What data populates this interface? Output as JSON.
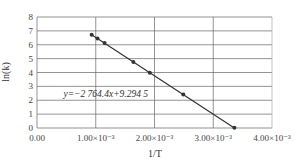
{
  "chart_data": {
    "type": "scatter",
    "title": "",
    "xlabel": "1/T",
    "ylabel": "ln(k)",
    "xlim": [
      0,
      0.004
    ],
    "ylim": [
      0,
      8
    ],
    "grid": true,
    "legend": "none",
    "x_ticks": [
      0,
      0.001,
      0.002,
      0.003,
      0.004
    ],
    "x_tick_labels": [
      "0.00",
      "1.00×10⁻³",
      "2.00×10⁻³",
      "3.00×10⁻³",
      "4.00×10⁻³"
    ],
    "y_ticks": [
      0,
      1,
      2,
      3,
      4,
      5,
      6,
      7,
      8
    ],
    "y_tick_labels": [
      "0",
      "1",
      "2",
      "3",
      "4",
      "5",
      "6",
      "7",
      "8"
    ],
    "series": [
      {
        "name": "ln(k) data",
        "x": [
          0.00093,
          0.00103,
          0.00115,
          0.00164,
          0.00192,
          0.00249,
          0.00336
        ],
        "y": [
          6.72,
          6.45,
          6.12,
          4.76,
          3.99,
          2.41,
          0.01
        ]
      }
    ],
    "trendline": {
      "type": "linear",
      "slope": -2764.4,
      "intercept": 9.2945,
      "x_range": [
        0.00093,
        0.00336
      ],
      "label": "y=−2 764.4x+9.294 5",
      "label_position": {
        "x": 0.00045,
        "y": 2.25
      }
    },
    "colors": {
      "grid": "#555555",
      "line": "#333333",
      "marker": "#333333",
      "text": "#333333"
    }
  }
}
